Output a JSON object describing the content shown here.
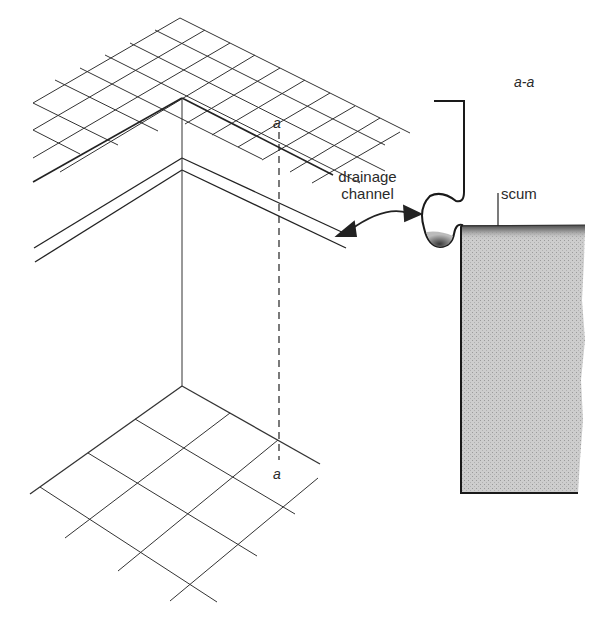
{
  "diagram": {
    "labels": {
      "section_title": "a-a",
      "section_marker_top": "a",
      "section_marker_bottom": "a",
      "drainage_line1": "drainage",
      "drainage_line2": "channel",
      "scum": "scum"
    },
    "colors": {
      "line": "#2a2a2a",
      "liquid_fill": "#c8c8c8",
      "scum_fill": "#6e6e6e",
      "background": "#ffffff"
    }
  }
}
